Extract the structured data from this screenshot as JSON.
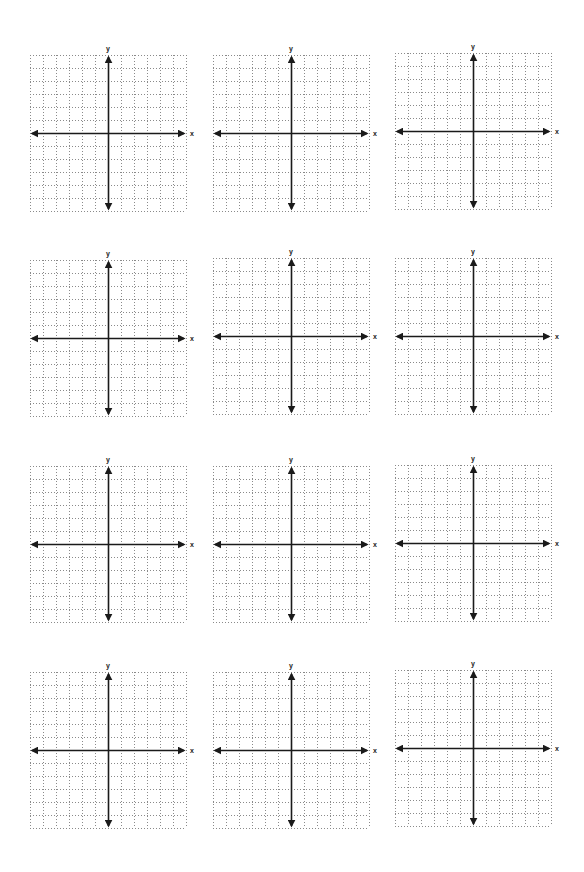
{
  "page": {
    "rows": 4,
    "columns": 3
  },
  "grid": {
    "cells_x": 12,
    "cells_y": 12,
    "cell_size_px": 13,
    "line_style": "dotted",
    "grid_color": "#8a8a8a",
    "axis_color": "#1a1a1a",
    "origin_cell": [
      6,
      6
    ]
  },
  "axes": {
    "x_label": "x",
    "y_label": "y"
  },
  "planes": [
    {
      "id": 1,
      "left": 30,
      "top": 55
    },
    {
      "id": 2,
      "left": 213,
      "top": 55
    },
    {
      "id": 3,
      "left": 395,
      "top": 53
    },
    {
      "id": 4,
      "left": 30,
      "top": 260
    },
    {
      "id": 5,
      "left": 213,
      "top": 258
    },
    {
      "id": 6,
      "left": 395,
      "top": 258
    },
    {
      "id": 7,
      "left": 30,
      "top": 466
    },
    {
      "id": 8,
      "left": 213,
      "top": 466
    },
    {
      "id": 9,
      "left": 395,
      "top": 465
    },
    {
      "id": 10,
      "left": 30,
      "top": 672
    },
    {
      "id": 11,
      "left": 213,
      "top": 672
    },
    {
      "id": 12,
      "left": 395,
      "top": 670
    }
  ]
}
